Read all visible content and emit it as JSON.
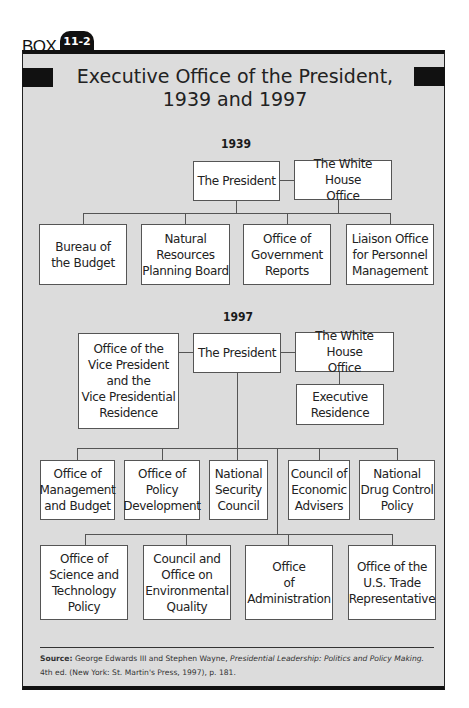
{
  "box": {
    "label": "BOX",
    "number": "11-2"
  },
  "title": {
    "line1": "Executive Office of the President,",
    "line2": "1939 and 1997"
  },
  "org_1939": {
    "year": "1939",
    "president": "The President",
    "white_house_office": "The White House\nOffice",
    "children": [
      "Bureau of\nthe Budget",
      "Natural\nResources\nPlanning Board",
      "Office of\nGovernment\nReports",
      "Liaison Office\nfor Personnel\nManagement"
    ]
  },
  "org_1997": {
    "year": "1997",
    "vice_president": "Office of the\nVice President\nand the\nVice Presidential\nResidence",
    "president": "The President",
    "white_house_office": "The White House\nOffice",
    "executive_residence": "Executive\nResidence",
    "row1": [
      "Office of\nManagement\nand Budget",
      "Office of\nPolicy\nDevelopment",
      "National\nSecurity\nCouncil",
      "Council of\nEconomic\nAdvisers",
      "National\nDrug Control\nPolicy"
    ],
    "row2": [
      "Office of\nScience and\nTechnology\nPolicy",
      "Council and\nOffice on\nEnvironmental\nQuality",
      "Office\nof\nAdministration",
      "Office of the\nU.S. Trade\nRepresentative"
    ]
  },
  "source": {
    "label": "Source:",
    "authors": "George Edwards III and Stephen Wayne,",
    "book_title": "Presidential Leadership: Politics and Policy Making.",
    "citation": "4th ed. (New York: St. Martin's Press, 1997), p. 181."
  }
}
